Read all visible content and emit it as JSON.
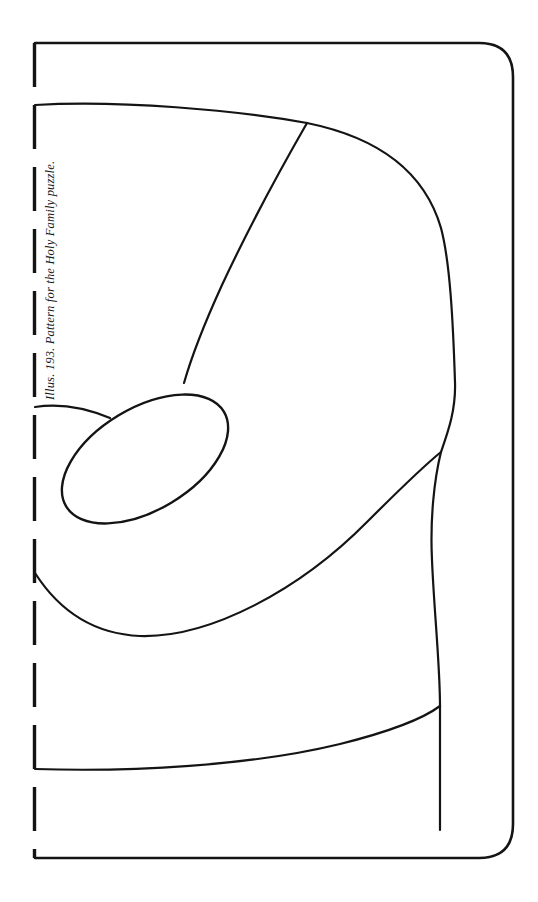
{
  "page": {
    "background_color": "#ffffff",
    "width": 538,
    "height": 902
  },
  "caption": {
    "text": "Illus. 193. Pattern for the Holy Family puzzle.",
    "figure_number": "193",
    "orientation": "rotated-90-ccw",
    "style": "italic-serif",
    "color": "#1a1a1a"
  },
  "figure": {
    "title": "Pattern for the Holy Family puzzle",
    "type": "line-drawing-pattern",
    "stroke_color": "#141414",
    "fill_color": "none",
    "fold_line_label": "dashed fold edge",
    "outer_frame": {
      "left": 35,
      "top": 43,
      "right": 513,
      "bottom": 858,
      "corner_radius_top_right": 34,
      "corner_radius_bottom_right": 34,
      "corner_style_left": "square",
      "stroke_width": 2.6
    },
    "fold_edge": {
      "x": 34,
      "y_start": 43,
      "y_end": 858,
      "dash_length": 44,
      "dash_gap": 18,
      "stroke_width": 3.4
    },
    "pieces": [
      {
        "name": "head-oval",
        "shape": "ellipse",
        "cx": 145,
        "cy": 459,
        "rx": 92,
        "ry": 51,
        "rotation_deg": -31
      },
      {
        "name": "upper-body-curve",
        "shape": "path"
      },
      {
        "name": "central-divider-curve",
        "shape": "path"
      },
      {
        "name": "lower-body-curve",
        "shape": "path"
      },
      {
        "name": "base-curve",
        "shape": "path"
      },
      {
        "name": "right-edge-curve",
        "shape": "path"
      },
      {
        "name": "shoulder-notch-curve",
        "shape": "path"
      }
    ]
  }
}
